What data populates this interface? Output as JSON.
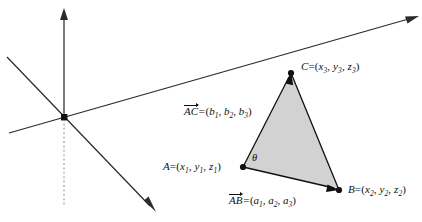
{
  "figure": {
    "background_color": "#ffffff",
    "line_color": "#111111",
    "triangle_fill": "#d2d2d2"
  },
  "axes": {
    "origin_label": "",
    "z_axis_name": "vertical-axis",
    "y_axis_name": "right-axis",
    "x_axis_name": "front-axis",
    "dashed_axis_name": "dashed-negative-vertical-axis"
  },
  "points": {
    "A": {
      "name": "A",
      "equals": "=",
      "coords_open": "(",
      "coords_close": ")",
      "x": "x",
      "y": "y",
      "z": "z",
      "sub": "1",
      "full": "A = (x1, y1, z1)"
    },
    "B": {
      "name": "B",
      "equals": "=",
      "coords_open": "(",
      "coords_close": ")",
      "x": "x",
      "y": "y",
      "z": "z",
      "sub": "2",
      "full": "B = (x2, y2, z2)"
    },
    "C": {
      "name": "C",
      "equals": "=",
      "coords_open": "(",
      "coords_close": ")",
      "x": "x",
      "y": "y",
      "z": "z",
      "sub": "3",
      "full": "C = (x3, y3, z3)"
    }
  },
  "vectors": {
    "AB": {
      "name": "AB",
      "equals": "=",
      "open": "(",
      "close": ")",
      "comp": "a",
      "sub1": "1",
      "sub2": "2",
      "sub3": "3",
      "full": "AB = (a1, a2, a3)"
    },
    "AC": {
      "name": "AC",
      "equals": "=",
      "open": "(",
      "close": ")",
      "comp": "b",
      "sub1": "1",
      "sub2": "2",
      "sub3": "3",
      "full": "AC = (b1, b2, b3)"
    }
  },
  "angle": {
    "symbol": "θ",
    "description": "angle at vertex A between AB and AC"
  }
}
